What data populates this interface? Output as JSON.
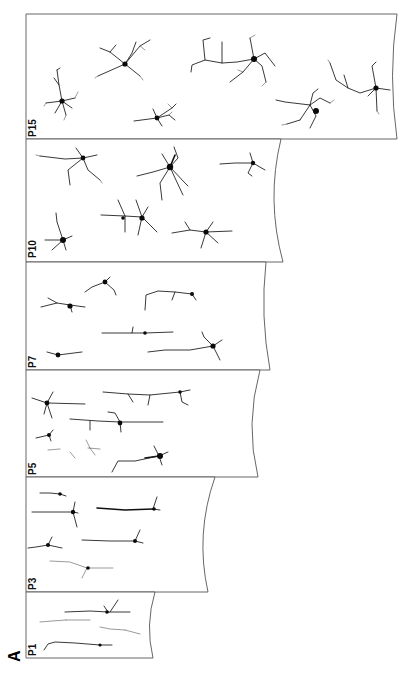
{
  "figure": {
    "letter": "A",
    "orientation": "rotated-90-ccw",
    "panels": [
      {
        "id": "p15",
        "label": "P15",
        "top": 14,
        "bottom": 139,
        "right": 397,
        "neuron_count": 7
      },
      {
        "id": "p10",
        "label": "P10",
        "top": 139,
        "bottom": 262,
        "right": 283,
        "neuron_count": 6
      },
      {
        "id": "p7",
        "label": "P7",
        "top": 262,
        "bottom": 370,
        "right": 270,
        "neuron_count": 6
      },
      {
        "id": "p5",
        "label": "P5",
        "top": 370,
        "bottom": 477,
        "right": 258,
        "neuron_count": 7
      },
      {
        "id": "p3",
        "label": "P3",
        "top": 477,
        "bottom": 592,
        "right": 208,
        "neuron_count": 6
      },
      {
        "id": "p1",
        "label": "P1",
        "top": 592,
        "bottom": 658,
        "right": 153,
        "neuron_count": 3
      }
    ]
  },
  "colors": {
    "background": "#ffffff",
    "outline": "#555555",
    "ink": "#111111"
  }
}
